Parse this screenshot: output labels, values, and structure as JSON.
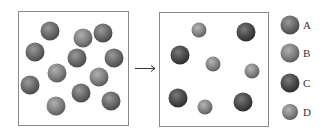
{
  "colors": {
    "A": {
      "light": "#9a9a9a",
      "mid": "#6e6e6e",
      "dark": "#4a4a4a"
    },
    "B": {
      "light": "#b0b0b0",
      "mid": "#858585",
      "dark": "#5c5c5c"
    },
    "C": {
      "light": "#7a7a7a",
      "mid": "#4e4e4e",
      "dark": "#2e2e2e"
    },
    "D": {
      "light": "#b5b5b5",
      "mid": "#8a8a8a",
      "dark": "#606060"
    }
  },
  "before_box": {
    "x": 18,
    "y": 11,
    "w": 110,
    "h": 114,
    "particles": [
      {
        "cx": 50,
        "cy": 31,
        "r": 9.5,
        "type": "A"
      },
      {
        "cx": 83,
        "cy": 38,
        "r": 9.5,
        "type": "B"
      },
      {
        "cx": 103,
        "cy": 33,
        "r": 9.5,
        "type": "A"
      },
      {
        "cx": 35,
        "cy": 52,
        "r": 9.5,
        "type": "A"
      },
      {
        "cx": 77,
        "cy": 58,
        "r": 9.5,
        "type": "A"
      },
      {
        "cx": 114,
        "cy": 58,
        "r": 9.5,
        "type": "A"
      },
      {
        "cx": 57,
        "cy": 73,
        "r": 9.5,
        "type": "B"
      },
      {
        "cx": 99,
        "cy": 77,
        "r": 9.5,
        "type": "B"
      },
      {
        "cx": 30,
        "cy": 85,
        "r": 9.5,
        "type": "A"
      },
      {
        "cx": 81,
        "cy": 93,
        "r": 9.5,
        "type": "A"
      },
      {
        "cx": 56,
        "cy": 106,
        "r": 9.5,
        "type": "B"
      },
      {
        "cx": 111,
        "cy": 101,
        "r": 9.5,
        "type": "A"
      }
    ]
  },
  "arrow": {
    "x1": 135,
    "y1": 68,
    "x2": 155,
    "y2": 68
  },
  "after_box": {
    "x": 159,
    "y": 12,
    "w": 109,
    "h": 114,
    "particles": [
      {
        "cx": 199,
        "cy": 30,
        "r": 7.5,
        "type": "D"
      },
      {
        "cx": 246,
        "cy": 32,
        "r": 9.5,
        "type": "C"
      },
      {
        "cx": 180,
        "cy": 55,
        "r": 9.5,
        "type": "C"
      },
      {
        "cx": 213,
        "cy": 64,
        "r": 7.5,
        "type": "D"
      },
      {
        "cx": 252,
        "cy": 71,
        "r": 7.5,
        "type": "D"
      },
      {
        "cx": 178,
        "cy": 98,
        "r": 9.5,
        "type": "C"
      },
      {
        "cx": 205,
        "cy": 107,
        "r": 7.5,
        "type": "D"
      },
      {
        "cx": 243,
        "cy": 102,
        "r": 9.5,
        "type": "C"
      }
    ]
  },
  "legend": [
    {
      "label": "A",
      "type": "A",
      "cx": 290,
      "cy": 25,
      "r": 9.5
    },
    {
      "label": "B",
      "type": "B",
      "cx": 290,
      "cy": 53,
      "r": 9.5
    },
    {
      "label": "C",
      "type": "C",
      "cx": 290,
      "cy": 83,
      "r": 9.5
    },
    {
      "label": "D",
      "type": "D",
      "cx": 290,
      "cy": 112,
      "r": 8
    }
  ]
}
